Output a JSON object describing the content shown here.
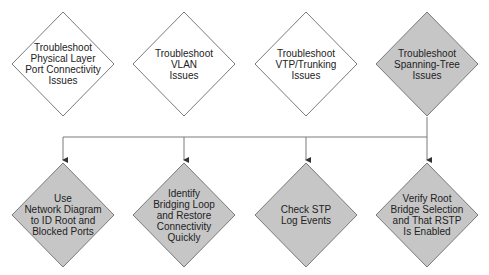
{
  "colors": {
    "diamond_white": "#ffffff",
    "diamond_gray": "#c6c6c6",
    "stroke": "#7a7a7a",
    "text": "#222222"
  },
  "top_row": [
    {
      "label": "Troubleshoot\nPhysical Layer\nPort Connectivity\nIssues",
      "highlighted": false
    },
    {
      "label": "Troubleshoot\nVLAN\nIssues",
      "highlighted": false
    },
    {
      "label": "Troubleshoot\nVTP/Trunking\nIssues",
      "highlighted": false
    },
    {
      "label": "Troubleshoot\nSpanning-Tree\nIssues",
      "highlighted": true
    }
  ],
  "bottom_row": [
    {
      "label": "Use\nNetwork Diagram\nto ID Root and\nBlocked Ports"
    },
    {
      "label": "Identify\nBridging Loop\nand Restore\nConnectivity\nQuickly"
    },
    {
      "label": "Check STP\nLog Events"
    },
    {
      "label": "Verify Root\nBridge Selection\nand That RSTP\nIs Enabled"
    }
  ]
}
